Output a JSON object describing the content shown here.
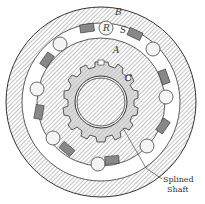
{
  "figure": {
    "labels": {
      "outer_race": "B",
      "inner_member": "A",
      "roller": "R",
      "spring": "S",
      "keyway": "C",
      "shaft_line1": "Splined",
      "shaft_line2": "Shaft"
    },
    "roller_count": 8,
    "colors": {
      "line": "#333333",
      "hatch": "#777777",
      "background": "#ffffff",
      "hub": "#bbbbbb"
    }
  }
}
